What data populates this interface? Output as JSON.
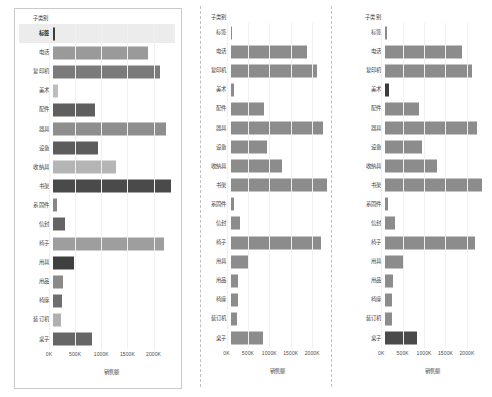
{
  "dimension_header": "子类别",
  "axis_title": "销售额",
  "axis_ticks": [
    "0K",
    "500K",
    "1000K",
    "1500K",
    "2000K"
  ],
  "categories": [
    "标签",
    "电话",
    "复印机",
    "美术",
    "配件",
    "器具",
    "设备",
    "收纳具",
    "书架",
    "系固件",
    "信封",
    "椅子",
    "用具",
    "用品",
    "椅座",
    "装订机",
    "桌子"
  ],
  "chart_data": [
    {
      "type": "bar",
      "orientation": "horizontal",
      "title": "",
      "xlabel": "销售额",
      "ylabel": "子类别",
      "xlim": [
        0,
        2400
      ],
      "grid": true,
      "highlight_row": "标签",
      "categories": [
        "标签",
        "电话",
        "复印机",
        "美术",
        "配件",
        "器具",
        "设备",
        "收纳具",
        "书架",
        "系固件",
        "信封",
        "椅子",
        "用具",
        "用品",
        "椅座",
        "装订机",
        "桌子"
      ],
      "values": [
        40,
        1870,
        2110,
        95,
        820,
        2240,
        890,
        1250,
        2340,
        75,
        230,
        2190,
        420,
        190,
        175,
        165,
        780
      ],
      "colors": [
        "#3c3c3c",
        "#9a9a9a",
        "#7b7b7b",
        "#bdbdbd",
        "#5f5f5f",
        "#8e8e8e",
        "#5c5c5c",
        "#b5b5b5",
        "#4a4a4a",
        "#878787",
        "#646464",
        "#9e9e9e",
        "#3f3f3f",
        "#8a8a8a",
        "#6e6e6e",
        "#b0b0b0",
        "#666666"
      ]
    },
    {
      "type": "bar",
      "orientation": "horizontal",
      "title": "",
      "xlabel": "销售额",
      "ylabel": "子类别",
      "xlim": [
        0,
        2400
      ],
      "grid": true,
      "highlight_row": "",
      "categories": [
        "标签",
        "电话",
        "复印机",
        "美术",
        "配件",
        "器具",
        "设备",
        "收纳具",
        "书架",
        "系固件",
        "信封",
        "椅子",
        "用具",
        "用品",
        "椅座",
        "装订机",
        "桌子"
      ],
      "values": [
        40,
        1870,
        2110,
        95,
        820,
        2240,
        890,
        1250,
        2340,
        75,
        230,
        2190,
        420,
        190,
        175,
        165,
        780
      ],
      "colors": [
        "#8c8c8c",
        "#8c8c8c",
        "#8c8c8c",
        "#8c8c8c",
        "#8c8c8c",
        "#8c8c8c",
        "#8c8c8c",
        "#8c8c8c",
        "#8c8c8c",
        "#8c8c8c",
        "#8c8c8c",
        "#8c8c8c",
        "#8c8c8c",
        "#8c8c8c",
        "#8c8c8c",
        "#8c8c8c",
        "#8c8c8c"
      ]
    },
    {
      "type": "bar",
      "orientation": "horizontal",
      "title": "",
      "xlabel": "销售额",
      "ylabel": "子类别",
      "xlim": [
        0,
        2400
      ],
      "grid": true,
      "highlight_row": "",
      "categories": [
        "标签",
        "电话",
        "复印机",
        "美术",
        "配件",
        "器具",
        "设备",
        "收纳具",
        "书架",
        "系固件",
        "信封",
        "椅子",
        "用具",
        "用品",
        "椅座",
        "装订机",
        "桌子"
      ],
      "values": [
        40,
        1870,
        2110,
        95,
        820,
        2240,
        890,
        1250,
        2340,
        75,
        230,
        2190,
        420,
        190,
        175,
        165,
        780
      ],
      "colors": [
        "#8c8c8c",
        "#8c8c8c",
        "#8c8c8c",
        "#3c3c3c",
        "#8c8c8c",
        "#8c8c8c",
        "#8c8c8c",
        "#8c8c8c",
        "#8c8c8c",
        "#8c8c8c",
        "#8c8c8c",
        "#8c8c8c",
        "#8c8c8c",
        "#8c8c8c",
        "#8c8c8c",
        "#8c8c8c",
        "#4a4a4a"
      ]
    }
  ]
}
